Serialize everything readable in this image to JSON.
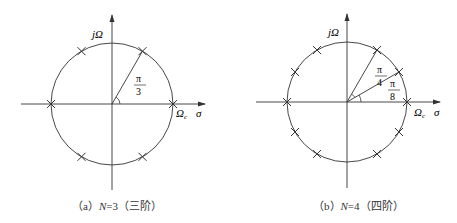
{
  "figures": [
    {
      "id": "a",
      "caption_prefix": "（a）",
      "caption_var": "N",
      "caption_eq": "=3（三阶）",
      "axis_y_label": "jΩ",
      "axis_x_label_c": "Ωc",
      "axis_x_label_sigma": "σ",
      "angle_label_num": "π",
      "angle_label_den": "3",
      "center": [
        112,
        104
      ],
      "radius": 61,
      "pole_angles_deg": [
        0,
        60,
        120,
        180,
        240,
        300
      ]
    },
    {
      "id": "b",
      "caption_prefix": "（b）",
      "caption_var": "N",
      "caption_eq": "=4（四阶）",
      "axis_y_label": "jΩ",
      "axis_x_label_c": "Ωc",
      "axis_x_label_sigma": "σ",
      "angle_label1_num": "π",
      "angle_label1_den": "4",
      "angle_label2_num": "π",
      "angle_label2_den": "8",
      "center": [
        347,
        102
      ],
      "radius": 60,
      "pole_angles_deg": [
        0,
        30,
        60,
        120,
        150,
        180,
        210,
        240,
        300,
        330
      ]
    }
  ],
  "colors": {
    "line": "#333333",
    "background": "#ffffff"
  }
}
